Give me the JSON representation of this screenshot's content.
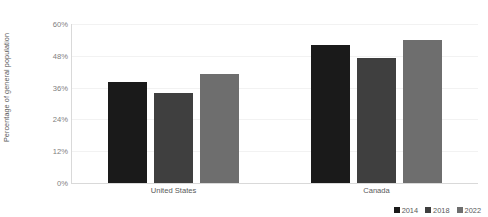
{
  "chart_data": {
    "type": "bar",
    "title": "",
    "subtitle": "",
    "xlabel": "",
    "ylabel": "Percentage of general population",
    "categories": [
      "United States",
      "Canada"
    ],
    "series": [
      {
        "name": "2014",
        "color": "#1a1a1a",
        "values": [
          38,
          52
        ]
      },
      {
        "name": "2018",
        "color": "#3f3f3f",
        "values": [
          34,
          47
        ]
      },
      {
        "name": "2022",
        "color": "#6e6e6e",
        "values": [
          41,
          54
        ]
      }
    ],
    "ylim": [
      0,
      60
    ],
    "ytick_values": [
      0,
      12,
      24,
      36,
      48,
      60
    ],
    "ytick_labels": [
      "0%",
      "12%",
      "24%",
      "36%",
      "48%",
      "60%"
    ],
    "grid": true,
    "grid_axis": "y",
    "legend_position": "bottom-right",
    "value_suffix": "%"
  },
  "axis": {
    "y_title": "Percentage of general population"
  },
  "colors": {
    "background": "#ffffff",
    "gridline": "#f2f2f2",
    "axis_line": "#d9d9d9",
    "tick_text": "#808080",
    "label_text": "#595959"
  }
}
